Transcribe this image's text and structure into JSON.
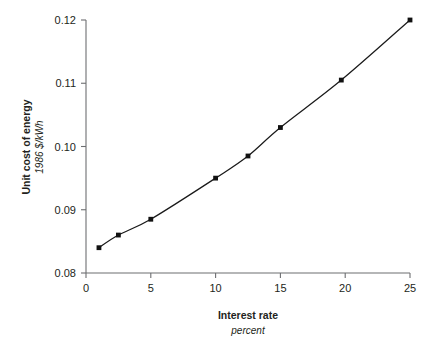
{
  "chart_data": {
    "type": "line",
    "title": "",
    "xlabel": "Interest rate",
    "xlabel_units": "percent",
    "ylabel": "Unit cost of energy",
    "ylabel_units": "1986 $/kWh",
    "xlim": [
      0,
      25
    ],
    "ylim": [
      0.08,
      0.12
    ],
    "xticks": [
      "0",
      "5",
      "10",
      "15",
      "20",
      "25"
    ],
    "xtick_values": [
      0,
      5,
      10,
      15,
      20,
      25
    ],
    "yticks": [
      "0.08",
      "0.09",
      "0.10",
      "0.11",
      "0.12"
    ],
    "ytick_values": [
      0.08,
      0.09,
      0.1,
      0.11,
      0.12
    ],
    "grid": false,
    "legend": "none",
    "marker": "square",
    "line_color": "#1a1a1a",
    "marker_color": "#111111",
    "axis_color": "#6d6e71",
    "x": [
      1,
      2.5,
      5,
      10,
      12.5,
      15,
      19.7,
      25
    ],
    "values": [
      0.084,
      0.086,
      0.0885,
      0.095,
      0.0985,
      0.103,
      0.1105,
      0.12
    ],
    "series": [
      {
        "name": "Unit cost of energy",
        "x": [
          1,
          2.5,
          5,
          10,
          12.5,
          15,
          19.7,
          25
        ],
        "values": [
          0.084,
          0.086,
          0.0885,
          0.095,
          0.0985,
          0.103,
          0.1105,
          0.12
        ]
      }
    ]
  }
}
